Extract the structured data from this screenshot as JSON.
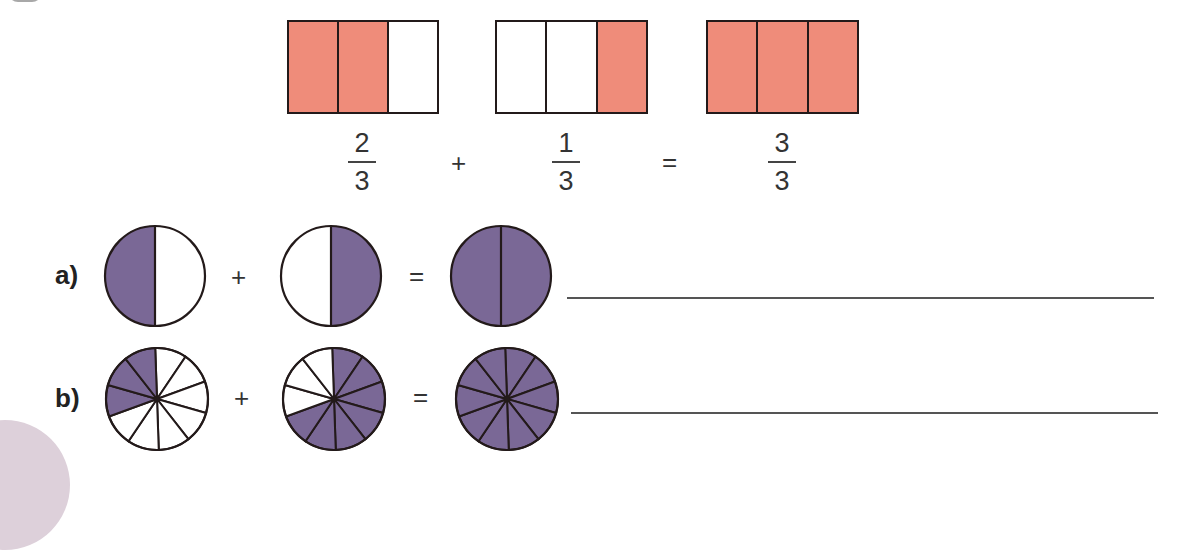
{
  "colors": {
    "bar_fill": "#ef8c7a",
    "circle_fill": "#7a6896",
    "outline": "#231a1a",
    "empty": "#ffffff"
  },
  "example": {
    "bars": [
      {
        "parts": 3,
        "shaded": [
          true,
          true,
          false
        ]
      },
      {
        "parts": 3,
        "shaded": [
          false,
          false,
          true
        ]
      },
      {
        "parts": 3,
        "shaded": [
          true,
          true,
          true
        ]
      }
    ],
    "fractions": [
      {
        "numerator": "2",
        "denominator": "3"
      },
      {
        "numerator": "1",
        "denominator": "3"
      },
      {
        "numerator": "3",
        "denominator": "3"
      }
    ],
    "plus": "+",
    "equals": "="
  },
  "exercises": [
    {
      "label": "a)",
      "plus": "+",
      "equals": "=",
      "circles": [
        {
          "parts": 2,
          "shaded_sectors": "left half"
        },
        {
          "parts": 2,
          "shaded_sectors": "right half"
        },
        {
          "parts": 2,
          "shaded_sectors": "all"
        }
      ],
      "answer": ""
    },
    {
      "label": "b)",
      "plus": "+",
      "equals": "=",
      "circles": [
        {
          "parts": 10,
          "shaded_count": 3
        },
        {
          "parts": 10,
          "shaded_count": 7
        },
        {
          "parts": 10,
          "shaded_count": 10
        }
      ],
      "answer": ""
    }
  ]
}
